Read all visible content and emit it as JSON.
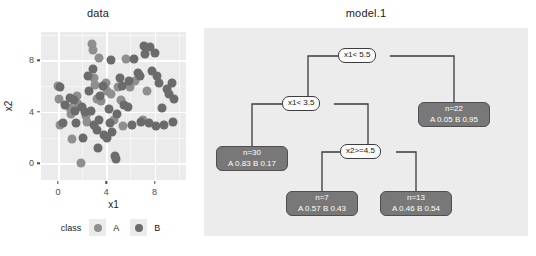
{
  "scatter": {
    "title": "data",
    "xlabel": "x1",
    "ylabel": "x2",
    "legend": {
      "title": "class",
      "items": [
        {
          "label": "A",
          "color": "#8f8f8f"
        },
        {
          "label": "B",
          "color": "#6b6b6b"
        }
      ]
    }
  },
  "tree": {
    "title": "model.1",
    "nodes": {
      "root": {
        "label": "x1< 5.5"
      },
      "split_left": {
        "label": "x1< 3.5"
      },
      "split_x2": {
        "label": "x2>=4.5"
      },
      "leaf_n30": {
        "line1": "n=30",
        "line2": "A 0.83  B 0.17"
      },
      "leaf_n7": {
        "line1": "n=7",
        "line2": "A 0.57  B 0.43"
      },
      "leaf_n13": {
        "line1": "n=13",
        "line2": "A 0.46  B 0.54"
      },
      "leaf_n22": {
        "line1": "n=22",
        "line2": "A 0.05  B 0.95"
      }
    }
  },
  "chart_data": {
    "type": "scatter",
    "title": "data",
    "xlabel": "x1",
    "ylabel": "x2",
    "xticks": [
      0,
      4,
      8
    ],
    "yticks": [
      0,
      4,
      8
    ],
    "xlim": [
      -1.4,
      10.6
    ],
    "ylim": [
      -1.3,
      10.2
    ],
    "grid": true,
    "legend_position": "bottom",
    "legend_title": "class",
    "series": [
      {
        "name": "A",
        "color": "#8f8f8f",
        "points": [
          [
            0.0,
            6.0
          ],
          [
            0.1,
            5.0
          ],
          [
            0.2,
            3.0
          ],
          [
            1.0,
            4.3
          ],
          [
            1.1,
            3.8
          ],
          [
            1.2,
            1.9
          ],
          [
            1.6,
            5.2
          ],
          [
            1.7,
            4.6
          ],
          [
            1.9,
            0.0
          ],
          [
            2.3,
            3.7
          ],
          [
            2.4,
            3.2
          ],
          [
            2.8,
            9.3
          ],
          [
            2.9,
            8.8
          ],
          [
            3.0,
            6.6
          ],
          [
            3.1,
            6.1
          ],
          [
            3.2,
            5.0
          ],
          [
            3.4,
            8.2
          ],
          [
            3.6,
            4.8
          ],
          [
            4.0,
            6.2
          ],
          [
            4.1,
            5.6
          ],
          [
            4.4,
            5.4
          ],
          [
            4.6,
            3.4
          ],
          [
            5.0,
            5.9
          ],
          [
            5.2,
            4.9
          ],
          [
            5.4,
            2.9
          ],
          [
            5.6,
            8.1
          ],
          [
            6.0,
            5.9
          ],
          [
            6.4,
            6.4
          ],
          [
            7.0,
            3.4
          ],
          [
            7.4,
            5.6
          ]
        ]
      },
      {
        "name": "B",
        "color": "#6b6b6b",
        "points": [
          [
            0.2,
            5.9
          ],
          [
            0.6,
            4.5
          ],
          [
            1.0,
            5.1
          ],
          [
            1.3,
            4.9
          ],
          [
            1.5,
            3.1
          ],
          [
            2.0,
            4.4
          ],
          [
            2.2,
            4.0
          ],
          [
            2.5,
            6.8
          ],
          [
            2.6,
            5.6
          ],
          [
            2.7,
            4.1
          ],
          [
            3.0,
            3.0
          ],
          [
            3.2,
            2.6
          ],
          [
            3.3,
            1.2
          ],
          [
            3.5,
            5.2
          ],
          [
            3.7,
            6.0
          ],
          [
            3.8,
            2.2
          ],
          [
            4.2,
            4.2
          ],
          [
            4.3,
            3.1
          ],
          [
            4.5,
            2.4
          ],
          [
            4.7,
            0.6
          ],
          [
            4.8,
            0.3
          ],
          [
            4.9,
            3.8
          ],
          [
            5.1,
            6.6
          ],
          [
            5.3,
            6.0
          ],
          [
            5.5,
            4.5
          ],
          [
            5.8,
            4.4
          ],
          [
            6.1,
            3.0
          ],
          [
            6.3,
            8.1
          ],
          [
            6.6,
            7.0
          ],
          [
            6.8,
            6.8
          ],
          [
            7.1,
            9.1
          ],
          [
            7.2,
            8.5
          ],
          [
            7.6,
            9.0
          ],
          [
            7.8,
            7.2
          ],
          [
            8.0,
            8.6
          ],
          [
            8.2,
            6.8
          ],
          [
            8.4,
            6.2
          ],
          [
            8.6,
            4.3
          ],
          [
            8.8,
            3.0
          ],
          [
            9.0,
            5.8
          ],
          [
            9.2,
            5.4
          ],
          [
            9.4,
            6.2
          ],
          [
            9.5,
            3.2
          ],
          [
            9.6,
            5.0
          ],
          [
            8.1,
            2.9
          ],
          [
            7.5,
            3.1
          ],
          [
            6.9,
            3.2
          ],
          [
            5.9,
            6.4
          ],
          [
            4.4,
            8.0
          ],
          [
            2.9,
            7.3
          ],
          [
            3.4,
            3.4
          ],
          [
            4.1,
            2.0
          ],
          [
            2.1,
            2.0
          ],
          [
            1.4,
            4.1
          ],
          [
            0.4,
            3.1
          ]
        ]
      }
    ]
  }
}
